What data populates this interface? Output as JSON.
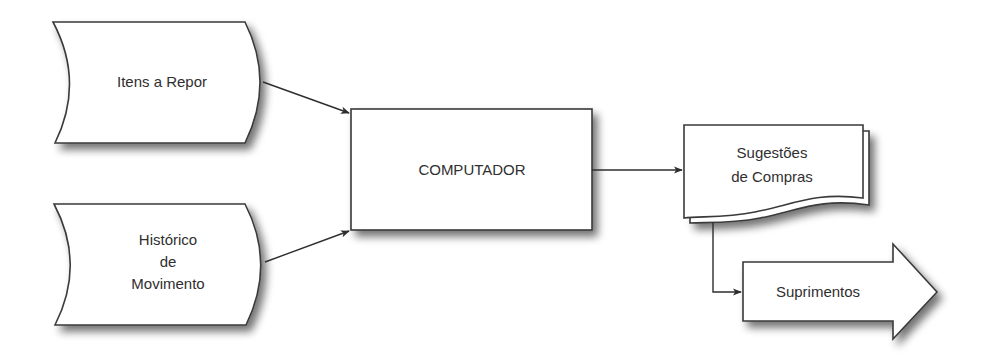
{
  "diagram": {
    "type": "flowchart",
    "nodes": {
      "itens_a_repor": {
        "shape": "stored-data",
        "lines": [
          "Itens a Repor"
        ]
      },
      "historico_movimento": {
        "shape": "stored-data",
        "lines": [
          "Histórico",
          "de",
          "Movimento"
        ]
      },
      "computador": {
        "shape": "process",
        "lines": [
          "COMPUTADOR"
        ]
      },
      "sugestoes_compras": {
        "shape": "multi-document",
        "lines": [
          "Sugestões",
          "de Compras"
        ]
      },
      "suprimentos": {
        "shape": "block-arrow",
        "lines": [
          "Suprimentos"
        ]
      }
    },
    "edges": [
      {
        "from": "Itens a Repor",
        "to": "COMPUTADOR"
      },
      {
        "from": "Histórico de Movimento",
        "to": "COMPUTADOR"
      },
      {
        "from": "COMPUTADOR",
        "to": "Sugestões de Compras"
      },
      {
        "from": "Sugestões de Compras",
        "to": "Suprimentos"
      }
    ],
    "colors": {
      "fill": "#ffffff",
      "stroke": "#3a3a3a",
      "text": "#2f2f2f",
      "shadow": "#7a7a7a"
    }
  }
}
